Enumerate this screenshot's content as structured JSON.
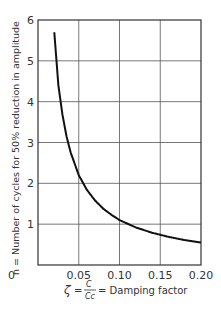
{
  "chart_data": {
    "type": "line",
    "title": "",
    "xlabel": "ζ = C/Cc = Damping factor",
    "xlabel_parts": {
      "symbol": "ζ",
      "eq": "=",
      "num": "C",
      "den": "Cc",
      "text": "= Damping factor"
    },
    "ylabel": "n = Number of cycles for 50% reduction in amplitude",
    "xlim": [
      0,
      0.2
    ],
    "ylim": [
      0,
      6
    ],
    "xticks": [
      0,
      0.05,
      0.1,
      0.15,
      0.2
    ],
    "xtick_labels": [
      "0",
      "0.05",
      "0.10",
      "0.15",
      "0.20"
    ],
    "yticks": [
      1,
      2,
      3,
      4,
      5,
      6
    ],
    "ytick_labels": [
      "1",
      "2",
      "3",
      "4",
      "5",
      "6"
    ],
    "grid": true,
    "legend": null,
    "series": [
      {
        "name": "n vs damping factor",
        "x": [
          0.02,
          0.025,
          0.03,
          0.035,
          0.04,
          0.05,
          0.06,
          0.07,
          0.08,
          0.09,
          0.1,
          0.12,
          0.14,
          0.15,
          0.16,
          0.18,
          0.2
        ],
        "y": [
          5.7,
          4.4,
          3.68,
          3.15,
          2.76,
          2.2,
          1.84,
          1.58,
          1.38,
          1.23,
          1.1,
          0.92,
          0.79,
          0.74,
          0.69,
          0.61,
          0.55
        ]
      }
    ]
  },
  "colors": {
    "curve": "#111111",
    "grid": "#555555",
    "axis": "#333333",
    "background": "#ffffff"
  }
}
